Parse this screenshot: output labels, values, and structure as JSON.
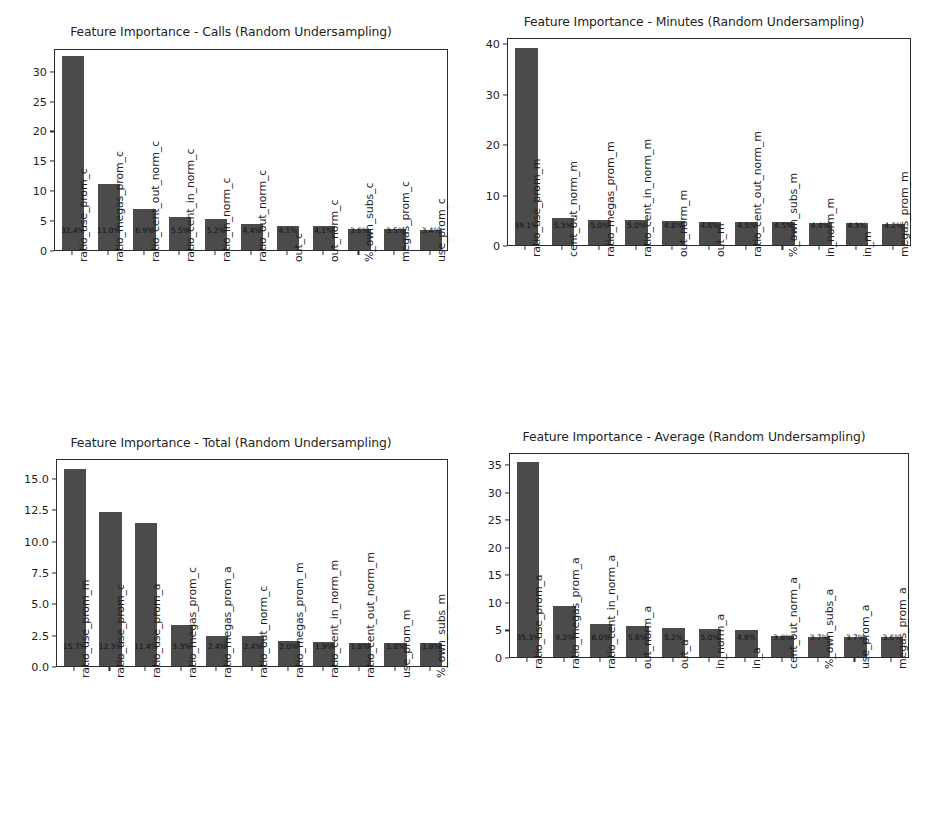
{
  "figure": {
    "width": 925,
    "height": 829,
    "background": "#ffffff",
    "bar_color": "#4b4b4b",
    "axis_color": "#2b2b2b",
    "text_color": "#1f1f1f"
  },
  "chart_data": [
    {
      "id": "calls",
      "type": "bar",
      "title": "Feature Importance - Calls (Random Undersampling)",
      "xlabel": "",
      "ylabel": "",
      "ylim": [
        0,
        33.8
      ],
      "yticks": [
        0,
        5,
        10,
        15,
        20,
        25,
        30
      ],
      "ytick_labels": [
        "0",
        "5",
        "10",
        "15",
        "20",
        "25",
        "30"
      ],
      "grid": false,
      "legend": "none",
      "categories": [
        "ratio_use_prom_c",
        "ratio_megas_prom_c",
        "ratio_cent_out_norm_c",
        "ratio_cent_in_norm_c",
        "ratio_in_norm_c",
        "ratio_out_norm_c",
        "out_c",
        "out_norm_c",
        "%_own_subs_c",
        "megas_prom_c",
        "use_prom_c"
      ],
      "values": [
        32.4,
        11.0,
        6.9,
        5.5,
        5.2,
        4.4,
        4.1,
        4.1,
        3.6,
        3.5,
        3.4
      ],
      "data_labels": [
        "32.4%",
        "11.0%",
        "6.9%",
        "5.5%",
        "5.2%",
        "4.4%",
        "4.1%",
        "4.1%",
        "3.6%",
        "3.5%",
        "3.4%"
      ]
    },
    {
      "id": "minutes",
      "type": "bar",
      "title": "Feature Importance - Minutes (Random Undersampling)",
      "xlabel": "",
      "ylabel": "",
      "ylim": [
        0,
        41.2
      ],
      "yticks": [
        0,
        10,
        20,
        30,
        40
      ],
      "ytick_labels": [
        "0",
        "10",
        "20",
        "30",
        "40"
      ],
      "grid": false,
      "legend": "none",
      "categories": [
        "ratio_use_prom_m",
        "cent_out_norm_m",
        "ratio_megas_prom_m",
        "ratio_cent_in_norm_m",
        "out_norm_m",
        "out_m",
        "ratio_cent_out_norm_m",
        "%_own_subs_m",
        "in_norm_m",
        "in_m",
        "megas_prom_m"
      ],
      "values": [
        39.1,
        5.3,
        5.0,
        5.0,
        4.8,
        4.6,
        4.5,
        4.5,
        4.4,
        4.3,
        4.2
      ],
      "data_labels": [
        "39.1%",
        "5.3%",
        "5.0%",
        "5.0%",
        "4.8%",
        "4.6%",
        "4.5%",
        "4.5%",
        "4.4%",
        "4.3%",
        "4.2%"
      ]
    },
    {
      "id": "total",
      "type": "bar",
      "title": "Feature Importance - Total (Random Undersampling)",
      "xlabel": "",
      "ylabel": "",
      "ylim": [
        0,
        16.6
      ],
      "yticks": [
        0.0,
        2.5,
        5.0,
        7.5,
        10.0,
        12.5,
        15.0
      ],
      "ytick_labels": [
        "0.0",
        "2.5",
        "5.0",
        "7.5",
        "10.0",
        "12.5",
        "15.0"
      ],
      "grid": false,
      "legend": "none",
      "categories": [
        "ratio_use_prom_m",
        "ratio_use_prom_c",
        "ratio_use_prom_a",
        "ratio_megas_prom_c",
        "ratio_megas_prom_a",
        "ratio_out_norm_c",
        "ratio_megas_prom_m",
        "ratio_cent_in_norm_m",
        "ratio_cent_out_norm_m",
        "use_prom_m",
        "%_own_subs_m"
      ],
      "values": [
        15.7,
        12.3,
        11.4,
        3.3,
        2.4,
        2.4,
        2.0,
        1.9,
        1.8,
        1.8,
        1.8
      ],
      "data_labels": [
        "15.7%",
        "12.3%",
        "11.4%",
        "3.3%",
        "2.4%",
        "2.4%",
        "2.0%",
        "1.9%",
        "1.8%",
        "1.8%",
        "1.8%"
      ]
    },
    {
      "id": "average",
      "type": "bar",
      "title": "Feature Importance - Average (Random Undersampling)",
      "xlabel": "",
      "ylabel": "",
      "ylim": [
        0,
        37.2
      ],
      "yticks": [
        0,
        5,
        10,
        15,
        20,
        25,
        30,
        35
      ],
      "ytick_labels": [
        "0",
        "5",
        "10",
        "15",
        "20",
        "25",
        "30",
        "35"
      ],
      "grid": false,
      "legend": "none",
      "categories": [
        "ratio_use_prom_a",
        "ratio_megas_prom_a",
        "ratio_cent_in_norm_a",
        "out_norm_a",
        "out_a",
        "in_norm_a",
        "in_a",
        "cent_out_norm_a",
        "%_own_subs_a",
        "use_prom_a",
        "megas_prom_a"
      ],
      "values": [
        35.3,
        9.2,
        6.0,
        5.6,
        5.2,
        5.0,
        4.9,
        3.8,
        3.7,
        3.7,
        3.6
      ],
      "data_labels": [
        "35.3%",
        "9.2%",
        "6.0%",
        "5.6%",
        "5.2%",
        "5.0%",
        "4.9%",
        "3.8%",
        "3.7%",
        "3.7%",
        "3.6%"
      ]
    }
  ]
}
